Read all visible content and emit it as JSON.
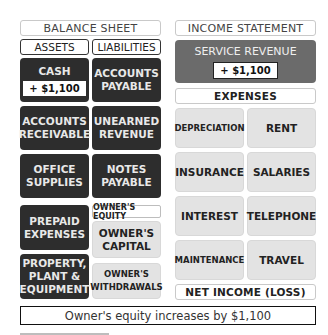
{
  "balance_sheet": {
    "title": "BALANCE SHEET",
    "assets_header": "ASSETS",
    "liabilities_header": "LIABILITIES",
    "assets": [
      {
        "line1": "CASH",
        "line2": "",
        "amount": "+ $1,100"
      },
      {
        "line1": "ACCOUNTS",
        "line2": "RECEIVABLE"
      },
      {
        "line1": "OFFICE",
        "line2": "SUPPLIES"
      },
      {
        "line1": "PREPAID",
        "line2": "EXPENSES"
      },
      {
        "line1": "PROPERTY,",
        "line2": "PLANT &",
        "line3": "EQUIPMENT"
      }
    ],
    "liabilities": [
      {
        "line1": "ACCOUNTS",
        "line2": "PAYABLE"
      },
      {
        "line1": "UNEARNED",
        "line2": "REVENUE"
      },
      {
        "line1": "NOTES",
        "line2": "PAYABLE"
      }
    ],
    "owners_equity_header": "OWNER'S EQUITY",
    "equity": [
      {
        "line1": "OWNER'S",
        "line2": "CAPITAL"
      },
      {
        "line1": "OWNER'S",
        "line2": "WITHDRAWALS"
      }
    ]
  },
  "income_statement": {
    "title": "INCOME STATEMENT",
    "revenue": {
      "label": "SERVICE REVENUE",
      "amount": "+ $1,100"
    },
    "expenses_header": "EXPENSES",
    "expenses": [
      "DEPRECIATION",
      "RENT",
      "INSURANCE",
      "SALARIES",
      "INTEREST",
      "TELEPHONE",
      "MAINTENANCE",
      "TRAVEL"
    ],
    "net_income": "NET INCOME (LOSS)"
  },
  "note": "Owner's equity increases by $1,100",
  "colors": {
    "dark": "#2d2d2d",
    "mid": "#6b6b6b",
    "light": "#e3e3e3"
  }
}
